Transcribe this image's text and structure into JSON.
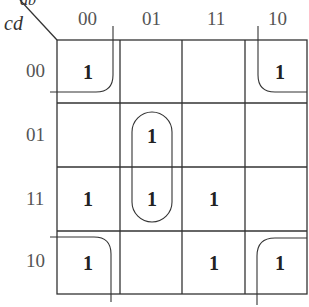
{
  "kmap": {
    "row_var": "cd",
    "col_var": "ab",
    "col_labels": [
      "00",
      "01",
      "11",
      "10"
    ],
    "row_labels": [
      "00",
      "01",
      "11",
      "10"
    ],
    "cells": [
      [
        "1",
        "",
        "",
        "1"
      ],
      [
        "",
        "1",
        "",
        ""
      ],
      [
        "1",
        "1",
        "1",
        ""
      ],
      [
        "1",
        "",
        "1",
        "1"
      ]
    ],
    "groupings": [
      {
        "name": "corners",
        "cells": [
          "00-00",
          "00-10",
          "10-00",
          "10-10"
        ]
      },
      {
        "name": "vertical-pair",
        "cells": [
          "01-01",
          "11-01"
        ]
      }
    ]
  }
}
